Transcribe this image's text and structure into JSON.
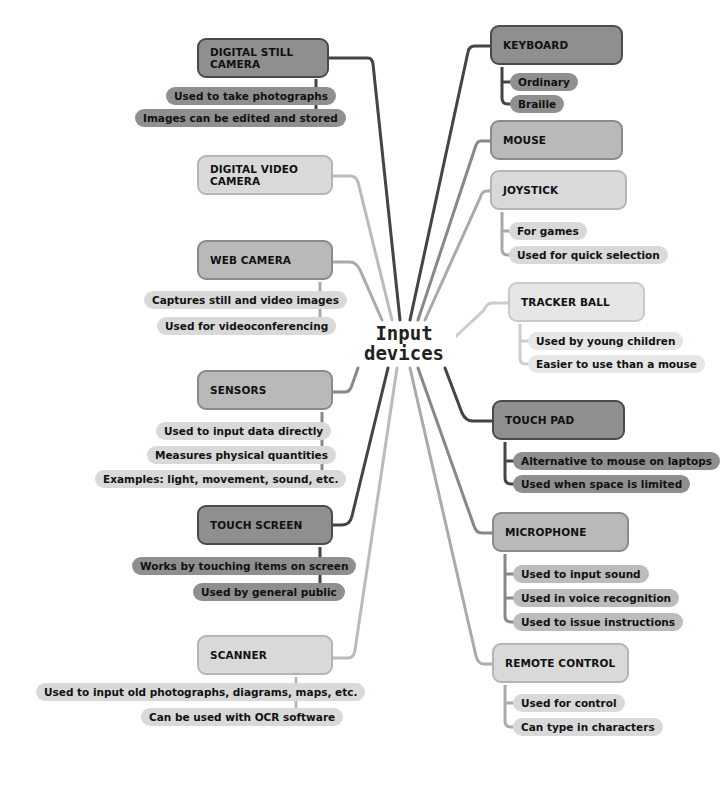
{
  "title": "Input devices",
  "colors": {
    "dark": "#8f8f8f",
    "mid": "#b9b9b9",
    "light": "#d9d9d9",
    "line_dark": "#444444",
    "line_mid": "#888888",
    "line_light": "#bbbbbb"
  },
  "center": {
    "line1": "Input",
    "line2": "devices"
  },
  "left": [
    {
      "label": "DIGITAL STILL CAMERA",
      "details": [
        "Used to take photographs",
        "Images can be edited and stored"
      ]
    },
    {
      "label": "DIGITAL VIDEO CAMERA",
      "details": []
    },
    {
      "label": "WEB CAMERA",
      "details": [
        "Captures still and video images",
        "Used for videoconferencing"
      ]
    },
    {
      "label": "SENSORS",
      "details": [
        "Used to input data directly",
        "Measures physical quantities",
        "Examples: light, movement, sound, etc."
      ]
    },
    {
      "label": "TOUCH SCREEN",
      "details": [
        "Works by touching items on screen",
        "Used by general public"
      ]
    },
    {
      "label": "SCANNER",
      "details": [
        "Used to input old photographs, diagrams, maps, etc.",
        "Can be used with OCR software"
      ]
    }
  ],
  "right": [
    {
      "label": "KEYBOARD",
      "details": [
        "Ordinary",
        "Braille"
      ]
    },
    {
      "label": "MOUSE",
      "details": []
    },
    {
      "label": "JOYSTICK",
      "details": [
        "For games",
        "Used for quick selection"
      ]
    },
    {
      "label": "TRACKER BALL",
      "details": [
        "Used by young children",
        "Easier to use than a mouse"
      ]
    },
    {
      "label": "TOUCH PAD",
      "details": [
        "Alternative to mouse on laptops",
        "Used when space is limited"
      ]
    },
    {
      "label": "MICROPHONE",
      "details": [
        "Used to input sound",
        "Used in voice recognition",
        "Used to issue instructions"
      ]
    },
    {
      "label": "REMOTE CONTROL",
      "details": [
        "Used for control",
        "Can type in characters"
      ]
    }
  ]
}
